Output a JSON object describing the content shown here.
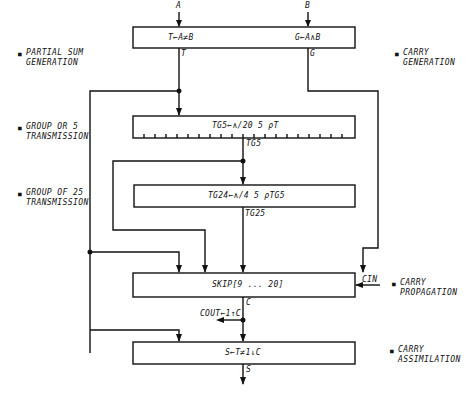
{
  "diagram": {
    "inputs": {
      "a": "A",
      "b": "B",
      "carry_in": "CIN"
    },
    "outputs": {
      "sum": "S",
      "carry_out": "COUT←1↑C"
    },
    "boxes": {
      "generation": {
        "left_expr": "T←A≠B",
        "right_expr": "G←A∧B",
        "out_left": "T",
        "out_right": "G"
      },
      "group5": {
        "expr": "TG5←∧/20 5 ρT",
        "out": "TG5",
        "ticks": 19
      },
      "group25": {
        "expr": "TG24←∧/4 5 ρTG5",
        "out": "TG25"
      },
      "skip": {
        "expr": "SKIP[9 ... 20]",
        "out": "C"
      },
      "assimilation": {
        "expr": "S←T≠1↓C"
      }
    },
    "side_labels": {
      "left": [
        {
          "bullet": "■",
          "line1": "PARTIAL SUM",
          "line2": "GENERATION"
        },
        {
          "bullet": "■",
          "line1": "GROUP OR 5",
          "line2": "TRANSMISSION"
        },
        {
          "bullet": "■",
          "line1": "GROUP OF 25",
          "line2": "TRANSMISSION"
        }
      ],
      "right": [
        {
          "bullet": "■",
          "line1": "CARRY",
          "line2": "GENERATION"
        },
        {
          "bullet": "■",
          "line1": "CARRY",
          "line2": "PROPAGATION"
        },
        {
          "bullet": "■",
          "line1": "CARRY",
          "line2": "ASSIMILATION"
        }
      ]
    },
    "colors": {
      "line": "#111111",
      "background": "#ffffff"
    }
  }
}
